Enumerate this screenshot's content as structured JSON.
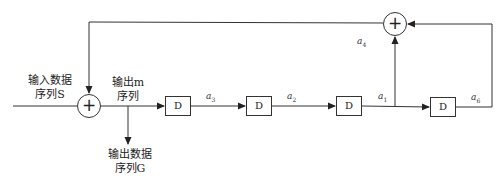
{
  "diagram": {
    "type": "linear feedback shift register (scrambler)",
    "input_label": [
      "输入数据",
      "序列S"
    ],
    "middle_label": [
      "输出m",
      "序列"
    ],
    "output_label": [
      "输出数据",
      "序列G"
    ],
    "delay_blocks": [
      {
        "label": "D",
        "output_tap": {
          "name": "a",
          "sub": "3"
        }
      },
      {
        "label": "D",
        "output_tap": {
          "name": "a",
          "sub": "2"
        }
      },
      {
        "label": "D",
        "output_tap": {
          "name": "a",
          "sub": "1"
        }
      },
      {
        "label": "D",
        "output_tap": {
          "name": "a",
          "sub": "6"
        }
      }
    ],
    "feedback_label": {
      "name": "a",
      "sub": "4"
    },
    "adders": [
      {
        "symbol": "+",
        "role": "input-xor"
      },
      {
        "symbol": "+",
        "role": "feedback-xor"
      }
    ],
    "colors": {
      "line": "#333333",
      "background": "#ffffff"
    }
  }
}
